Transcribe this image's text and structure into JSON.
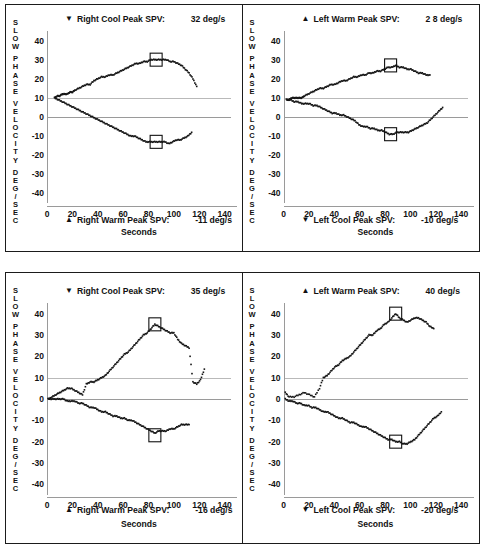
{
  "figure": {
    "axis_title_vertical": "SLOW PHASE VELOCITY DEG/SEC",
    "axis_title_horizontal": "Seconds",
    "y_ticks": [
      "40",
      "30",
      "20",
      "10",
      "0",
      "-10",
      "-20",
      "-30",
      "-40"
    ],
    "x_ticks": [
      "0",
      "20",
      "40",
      "60",
      "80",
      "100",
      "120",
      "140"
    ],
    "units": "deg/s",
    "colors": {
      "ink": "#151515",
      "grid": "#b9b9b9",
      "frame": "#1b1b1b",
      "axis": "#9a9a9a"
    }
  },
  "panels": [
    {
      "id": "top-left",
      "top_header": {
        "marker": "▼",
        "label": "Right Cool Peak SPV:",
        "value": "32 deg/s"
      },
      "bottom_header": {
        "marker": "▲",
        "label": "Right Warm Peak SPV:",
        "value": "-11 deg/s"
      }
    },
    {
      "id": "top-right",
      "top_header": {
        "marker": "▲",
        "label": "Left Warm Peak SPV:",
        "value": "2 8 deg/s"
      },
      "bottom_header": {
        "marker": "▼",
        "label": "Left Cool Peak SPV:",
        "value": "-10 deg/s"
      }
    },
    {
      "id": "bottom-left",
      "top_header": {
        "marker": "▼",
        "label": "Right Cool Peak SPV:",
        "value": "35 deg/s"
      },
      "bottom_header": {
        "marker": "▲",
        "label": "Right Warm Peak SPV:",
        "value": "-16 deg/s"
      }
    },
    {
      "id": "bottom-right",
      "top_header": {
        "marker": "▲",
        "label": "Left Warm Peak SPV:",
        "value": "40 deg/s"
      },
      "bottom_header": {
        "marker": "▼",
        "label": "Left Cool Peak SPV:",
        "value": "-20 deg/s"
      }
    }
  ],
  "chart_data": [
    {
      "id": "top-left",
      "type": "scatter",
      "title": "Right Cool / Right Warm Peak SPV",
      "xlabel": "Seconds",
      "ylabel": "SLOW PHASE VELOCITY DEG/SEC",
      "xlim": [
        0,
        145
      ],
      "ylim": [
        -45,
        45
      ],
      "grid": true,
      "peak_markers": [
        {
          "series": "Right Cool",
          "x": 86,
          "y": 30,
          "label": "32 deg/s"
        },
        {
          "series": "Right Warm",
          "x": 86,
          "y": -13,
          "label": "-11 deg/s"
        }
      ],
      "series": [
        {
          "name": "Right Cool",
          "marker": "▼",
          "x": [
            6,
            8,
            10,
            12,
            14,
            16,
            18,
            20,
            22,
            25,
            28,
            31,
            34,
            37,
            40,
            43,
            46,
            49,
            52,
            55,
            58,
            61,
            64,
            67,
            70,
            73,
            76,
            79,
            82,
            85,
            88,
            91,
            94,
            97,
            100,
            103,
            106,
            109,
            112,
            115,
            118
          ],
          "y": [
            10,
            11,
            11,
            12,
            12,
            12,
            13,
            13,
            14,
            15,
            16,
            17,
            17,
            19,
            20,
            21,
            21,
            22,
            22,
            23,
            24,
            25,
            26,
            27,
            28,
            28,
            29,
            29,
            30,
            30,
            30,
            30,
            30,
            29,
            29,
            28,
            27,
            25,
            23,
            20,
            16
          ]
        },
        {
          "name": "Right Warm",
          "marker": "▲",
          "x": [
            6,
            9,
            12,
            15,
            18,
            21,
            24,
            27,
            30,
            33,
            36,
            39,
            42,
            45,
            48,
            51,
            54,
            57,
            60,
            63,
            66,
            69,
            72,
            75,
            78,
            81,
            84,
            87,
            90,
            93,
            96,
            99,
            102,
            105,
            108,
            111,
            114
          ],
          "y": [
            10,
            9,
            8,
            7,
            6,
            5,
            4,
            3,
            2,
            1,
            0,
            -1,
            -2,
            -3,
            -4,
            -5,
            -6,
            -7,
            -8,
            -9,
            -10,
            -10,
            -11,
            -12,
            -13,
            -13,
            -13,
            -13,
            -13,
            -13,
            -14,
            -13,
            -12,
            -12,
            -11,
            -10,
            -8
          ]
        }
      ]
    },
    {
      "id": "top-right",
      "type": "scatter",
      "title": "Left Warm / Left Cool Peak SPV",
      "xlabel": "Seconds",
      "ylabel": "SLOW PHASE VELOCITY DEG/SEC",
      "xlim": [
        0,
        145
      ],
      "ylim": [
        -45,
        45
      ],
      "grid": true,
      "peak_markers": [
        {
          "series": "Left Warm",
          "x": 84,
          "y": 27,
          "label": "2 8 deg/s"
        },
        {
          "series": "Left Cool",
          "x": 84,
          "y": -9,
          "label": "-10 deg/s"
        }
      ],
      "series": [
        {
          "name": "Left Warm",
          "marker": "▲",
          "x": [
            2,
            4,
            6,
            8,
            10,
            12,
            14,
            16,
            19,
            22,
            25,
            28,
            31,
            34,
            37,
            40,
            43,
            46,
            49,
            52,
            55,
            58,
            61,
            64,
            67,
            70,
            73,
            76,
            79,
            82,
            85,
            88,
            91,
            94,
            97,
            100,
            103,
            106,
            109,
            112,
            115
          ],
          "y": [
            9,
            9,
            10,
            10,
            10,
            10,
            10,
            11,
            12,
            13,
            14,
            15,
            15,
            16,
            17,
            17,
            18,
            19,
            19,
            20,
            21,
            21,
            22,
            22,
            23,
            23,
            24,
            24,
            25,
            26,
            26,
            27,
            26,
            26,
            25,
            25,
            24,
            23,
            23,
            22,
            22
          ]
        },
        {
          "name": "Left Cool",
          "marker": "▼",
          "x": [
            2,
            5,
            8,
            11,
            14,
            17,
            20,
            23,
            26,
            29,
            32,
            35,
            38,
            41,
            44,
            47,
            50,
            53,
            56,
            59,
            62,
            65,
            68,
            71,
            74,
            77,
            80,
            83,
            86,
            89,
            92,
            95,
            98,
            101,
            104,
            107,
            110,
            113,
            116,
            119,
            122,
            125
          ],
          "y": [
            9,
            9,
            8,
            8,
            7,
            7,
            7,
            6,
            6,
            5,
            4,
            3,
            2,
            2,
            1,
            1,
            0,
            -1,
            -2,
            -4,
            -5,
            -5,
            -6,
            -6,
            -7,
            -7,
            -8,
            -9,
            -9,
            -8,
            -8,
            -8,
            -8,
            -7,
            -6,
            -5,
            -4,
            -3,
            -1,
            1,
            3,
            5
          ]
        }
      ]
    },
    {
      "id": "bottom-left",
      "type": "scatter",
      "title": "Right Cool / Right Warm Peak SPV",
      "xlabel": "Seconds",
      "ylabel": "SLOW PHASE VELOCITY DEG/SEC",
      "xlim": [
        0,
        145
      ],
      "ylim": [
        -45,
        45
      ],
      "grid": true,
      "peak_markers": [
        {
          "series": "Right Cool",
          "x": 85,
          "y": 35,
          "label": "35 deg/s"
        },
        {
          "series": "Right Warm",
          "x": 85,
          "y": -17,
          "label": "-16 deg/s"
        }
      ],
      "series": [
        {
          "name": "Right Cool",
          "marker": "▼",
          "x": [
            1,
            4,
            7,
            10,
            13,
            16,
            19,
            22,
            25,
            28,
            31,
            34,
            37,
            40,
            43,
            46,
            49,
            52,
            55,
            58,
            61,
            64,
            67,
            70,
            73,
            76,
            79,
            82,
            85,
            88,
            91,
            94,
            97,
            100,
            103,
            106,
            109,
            112,
            115,
            118,
            121,
            124
          ],
          "y": [
            0,
            1,
            2,
            3,
            4,
            5,
            5,
            4,
            3,
            2,
            7,
            8,
            8,
            9,
            10,
            11,
            13,
            15,
            17,
            19,
            21,
            22,
            24,
            26,
            28,
            30,
            31,
            33,
            35,
            34,
            33,
            32,
            31,
            31,
            28,
            26,
            25,
            24,
            8,
            7,
            9,
            14
          ]
        },
        {
          "name": "Right Warm",
          "marker": "▲",
          "x": [
            1,
            4,
            7,
            10,
            13,
            16,
            19,
            22,
            25,
            28,
            31,
            34,
            37,
            40,
            43,
            46,
            49,
            52,
            55,
            58,
            61,
            64,
            67,
            70,
            73,
            76,
            79,
            82,
            85,
            88,
            91,
            94,
            97,
            100,
            103,
            106,
            109,
            112
          ],
          "y": [
            0,
            0,
            0,
            0,
            0,
            -1,
            -1,
            -1,
            -2,
            -2,
            -3,
            -4,
            -4,
            -5,
            -6,
            -6,
            -7,
            -8,
            -8,
            -9,
            -9,
            -10,
            -10,
            -11,
            -12,
            -13,
            -14,
            -15,
            -16,
            -15,
            -15,
            -15,
            -14,
            -14,
            -13,
            -12,
            -12,
            -12
          ]
        }
      ]
    },
    {
      "id": "bottom-right",
      "type": "scatter",
      "title": "Left Warm / Left Cool Peak SPV",
      "xlabel": "Seconds",
      "ylabel": "SLOW PHASE VELOCITY DEG/SEC",
      "xlim": [
        0,
        145
      ],
      "ylim": [
        -45,
        45
      ],
      "grid": true,
      "peak_markers": [
        {
          "series": "Left Warm",
          "x": 88,
          "y": 40,
          "label": "40 deg/s"
        },
        {
          "series": "Left Cool",
          "x": 88,
          "y": -20,
          "label": "-20 deg/s"
        }
      ],
      "series": [
        {
          "name": "Left Warm",
          "marker": "▲",
          "x": [
            1,
            4,
            8,
            12,
            16,
            20,
            24,
            28,
            31,
            34,
            37,
            40,
            43,
            46,
            49,
            52,
            55,
            58,
            61,
            64,
            67,
            70,
            73,
            76,
            79,
            82,
            85,
            88,
            91,
            94,
            97,
            100,
            103,
            106,
            109,
            112,
            115,
            118
          ],
          "y": [
            3,
            1,
            1,
            2,
            3,
            2,
            1,
            5,
            10,
            11,
            13,
            15,
            16,
            18,
            19,
            20,
            22,
            24,
            26,
            28,
            30,
            30,
            32,
            33,
            35,
            36,
            38,
            40,
            38,
            37,
            36,
            37,
            38,
            38,
            37,
            36,
            34,
            33
          ]
        },
        {
          "name": "Left Cool",
          "marker": "▼",
          "x": [
            1,
            4,
            7,
            10,
            13,
            16,
            19,
            22,
            25,
            28,
            31,
            34,
            37,
            40,
            43,
            46,
            49,
            52,
            55,
            58,
            61,
            64,
            67,
            70,
            73,
            76,
            79,
            82,
            85,
            88,
            91,
            94,
            97,
            100,
            103,
            106,
            109,
            112,
            115,
            118,
            121,
            124
          ],
          "y": [
            0,
            -1,
            -1,
            -2,
            -2,
            -3,
            -3,
            -4,
            -4,
            -5,
            -6,
            -6,
            -7,
            -8,
            -9,
            -9,
            -10,
            -11,
            -11,
            -12,
            -13,
            -13,
            -14,
            -15,
            -16,
            -17,
            -18,
            -19,
            -19,
            -20,
            -20,
            -21,
            -21,
            -20,
            -19,
            -17,
            -15,
            -13,
            -11,
            -9,
            -8,
            -6
          ]
        }
      ]
    }
  ]
}
